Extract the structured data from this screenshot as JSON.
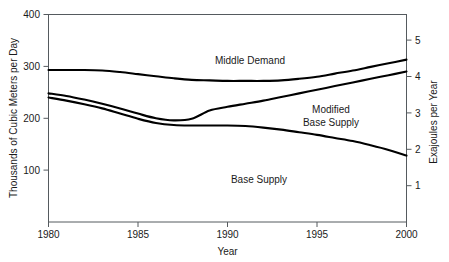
{
  "chart_data": {
    "type": "line",
    "title": "",
    "xlabel": "Year",
    "ylabel": "Thousands of Cubic Meters per Day",
    "ylabel_right": "Exajoules per Year",
    "xlim": [
      1980,
      2000
    ],
    "ylim": [
      0,
      400
    ],
    "ylim_right": [
      0,
      5.44
    ],
    "grid": false,
    "legend": "inline-labels",
    "xticks": [
      1980,
      1985,
      1990,
      1995,
      2000
    ],
    "xtick_labels": [
      "1980",
      "1985",
      "1990",
      "1995",
      "2000"
    ],
    "yticks": [
      100,
      200,
      300,
      400
    ],
    "ytick_labels": [
      "100",
      "200",
      "300",
      "400"
    ],
    "yticks_right": [
      1,
      2,
      3,
      4,
      5
    ],
    "ytick_labels_right": [
      "1",
      "2",
      "3",
      "4",
      "5"
    ],
    "x": [
      1980,
      1981,
      1982,
      1983,
      1984,
      1985,
      1986,
      1987,
      1988,
      1989,
      1990,
      1991,
      1992,
      1993,
      1994,
      1995,
      1996,
      1997,
      1998,
      1999,
      2000
    ],
    "series": [
      {
        "name": "Middle Demand",
        "label": "Middle Demand",
        "values": [
          293,
          293,
          293,
          292,
          289,
          285,
          281,
          277,
          274,
          273,
          272,
          272,
          272,
          273,
          276,
          280,
          286,
          292,
          299,
          306,
          313
        ]
      },
      {
        "name": "Modified Base Supply",
        "label": "Modified\nBase Supply",
        "label_line1": "Modified",
        "label_line2": "Base Supply",
        "values": [
          248,
          243,
          236,
          228,
          219,
          209,
          200,
          196,
          199,
          215,
          222,
          228,
          234,
          241,
          248,
          255,
          262,
          269,
          276,
          283,
          290
        ]
      },
      {
        "name": "Base Supply",
        "label": "Base Supply",
        "values": [
          240,
          234,
          227,
          219,
          209,
          199,
          191,
          187,
          186,
          186,
          186,
          185,
          182,
          178,
          173,
          168,
          162,
          156,
          148,
          139,
          128
        ]
      }
    ]
  },
  "axes": {
    "left_title": "Thousands of Cubic Meters per Day",
    "right_title": "Exajoules per Year",
    "bottom_title": "Year"
  },
  "labels": {
    "middle_demand": "Middle Demand",
    "modified_line1": "Modified",
    "modified_line2": "Base Supply",
    "base_supply": "Base Supply"
  },
  "colors": {
    "curve": "#000000",
    "axis": "#555a5e",
    "text": "#1a1a1a",
    "background": "#ffffff"
  }
}
